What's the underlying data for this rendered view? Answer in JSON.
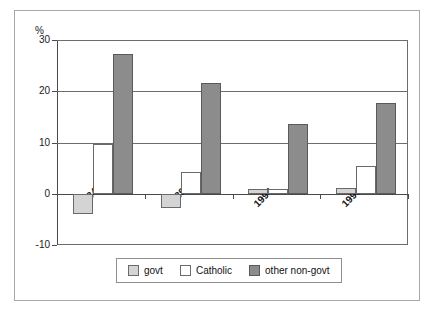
{
  "chart_data": {
    "type": "bar",
    "title": "",
    "xlabel": "",
    "ylabel": "%",
    "ylim": [
      -10,
      30
    ],
    "yticks": [
      30,
      20,
      10,
      0,
      -10
    ],
    "ytick_labels": [
      "30",
      "20",
      "10",
      "0",
      "-10"
    ],
    "grid": true,
    "gridlines_at": [
      30,
      20,
      10,
      0
    ],
    "legend_position": "bottom-center",
    "categories": [
      "1984",
      "1989",
      "1994",
      "1999"
    ],
    "series": [
      {
        "name": "govt",
        "color": "#d4d4d4",
        "values": [
          -4.0,
          -2.7,
          0.9,
          1.2
        ]
      },
      {
        "name": "Catholic",
        "color": "#ffffff",
        "values": [
          9.7,
          4.3,
          0.9,
          5.4
        ]
      },
      {
        "name": "other non-govt",
        "color": "#8c8c8c",
        "values": [
          27.3,
          21.7,
          13.7,
          17.7
        ]
      }
    ]
  },
  "axis": {
    "y_unit_label": "%"
  },
  "legend": {
    "entries": [
      {
        "label": "govt",
        "swatch_class": "sw-govt"
      },
      {
        "label": "Catholic",
        "swatch_class": "sw-catholic"
      },
      {
        "label": "other non-govt",
        "swatch_class": "sw-othernongovt"
      }
    ]
  },
  "colors": {
    "govt": "#d4d4d4",
    "catholic": "#ffffff",
    "other_non_govt": "#8c8c8c",
    "axis": "#4a4a4a",
    "gridline": "#6d6d6d",
    "frame": "#a8a8a8"
  }
}
